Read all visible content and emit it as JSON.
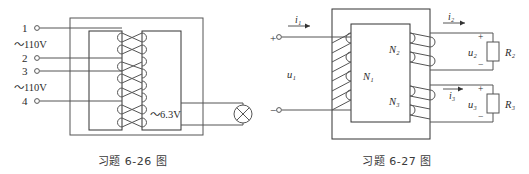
{
  "page": {
    "background": "#ffffff",
    "line_color": "#555555",
    "text_color": "#2b2b2b"
  },
  "figures": [
    {
      "id": "fig-6-26",
      "caption": "习题 6-26 图",
      "title": "transformer-with-lamp",
      "terminals": [
        {
          "name": "terminal-1",
          "label": "1",
          "y": 28
        },
        {
          "name": "terminal-2",
          "label": "2",
          "y": 58
        },
        {
          "name": "terminal-3",
          "label": "3",
          "y": 71
        },
        {
          "name": "terminal-4",
          "label": "4",
          "y": 101
        }
      ],
      "voltage_labels": [
        {
          "name": "primary-voltage-top",
          "label": "～110V",
          "y": 44
        },
        {
          "name": "primary-voltage-bottom",
          "label": "～110V",
          "y": 87
        }
      ],
      "secondary_label": {
        "name": "secondary-voltage",
        "label": "～6.3V"
      },
      "lamp": {
        "name": "lamp-symbol",
        "type": "crossed-circle"
      }
    },
    {
      "id": "fig-6-27",
      "caption": "习题 6-27 图",
      "title": "three-winding-transformer",
      "windings": [
        {
          "name": "winding-n1",
          "label": "N₁"
        },
        {
          "name": "winding-n2",
          "label": "N₂"
        },
        {
          "name": "winding-n3",
          "label": "N₃"
        }
      ],
      "currents": [
        {
          "name": "current-i1",
          "label": "i₁"
        },
        {
          "name": "current-i2",
          "label": "i₂"
        },
        {
          "name": "current-i3",
          "label": "i₃"
        }
      ],
      "voltages": [
        {
          "name": "voltage-u1",
          "label": "u₁"
        },
        {
          "name": "voltage-u2",
          "label": "u₂"
        },
        {
          "name": "voltage-u3",
          "label": "u₃"
        }
      ],
      "resistors": [
        {
          "name": "resistor-r2",
          "label": "R₂"
        },
        {
          "name": "resistor-r3",
          "label": "R₃"
        }
      ],
      "polarity": {
        "primary_plus": "+",
        "primary_minus": "−",
        "r2_plus": "+",
        "r2_minus": "−",
        "r3_plus": "+",
        "r3_minus": "−"
      }
    }
  ]
}
